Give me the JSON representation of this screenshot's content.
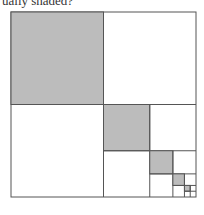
{
  "caption": {
    "text": "ually shaded?"
  },
  "diagram": {
    "outer": {
      "x": 11,
      "y": 12,
      "size": 185
    },
    "levels": 5,
    "shaded_quadrant": "top-left",
    "colors": {
      "shade": "#bcbcbc",
      "stroke": "#555555",
      "background": "#ffffff"
    }
  }
}
